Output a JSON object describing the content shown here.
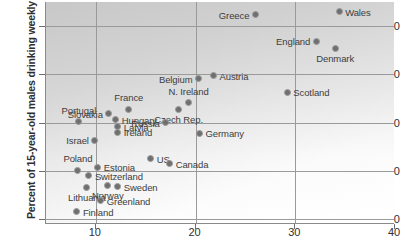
{
  "chart_data": {
    "type": "scatter",
    "title": "",
    "xlabel": "",
    "ylabel": "Percent of 15-year-old males drinking weekly",
    "xlim": [
      5,
      40
    ],
    "ylim": [
      9,
      55
    ],
    "xticks": [
      10,
      20,
      30,
      40
    ],
    "yticks": [
      10,
      20,
      30,
      40,
      50
    ],
    "grid": true,
    "legend": "none",
    "marker_color": "#6f6f6f",
    "marker_edge_color": "#9b9b9b",
    "grid_color": "#9a9a9a",
    "axis_color": "#8a8a8a",
    "points": [
      {
        "label": "Wales",
        "x": 34.4,
        "y": 53.0,
        "side": "r"
      },
      {
        "label": "Greece",
        "x": 26.0,
        "y": 52.4,
        "side": "l"
      },
      {
        "label": "England",
        "x": 32.1,
        "y": 46.9,
        "side": "l"
      },
      {
        "label": "Denmark",
        "x": 34.0,
        "y": 45.4,
        "side": "b"
      },
      {
        "label": "Austria",
        "x": 21.8,
        "y": 39.7,
        "side": "r"
      },
      {
        "label": "Belgium",
        "x": 20.3,
        "y": 39.1,
        "side": "l"
      },
      {
        "label": "Scotland",
        "x": 29.2,
        "y": 36.3,
        "side": "r"
      },
      {
        "label": "N. Ireland",
        "x": 19.3,
        "y": 34.1,
        "side": "t"
      },
      {
        "label": "Czech Rep.",
        "x": 18.3,
        "y": 32.8,
        "side": "b"
      },
      {
        "label": "France",
        "x": 13.3,
        "y": 32.8,
        "side": "t"
      },
      {
        "label": "Slovakia",
        "x": 11.3,
        "y": 31.8,
        "side": "l"
      },
      {
        "label": "Portugal",
        "x": 8.3,
        "y": 30.2,
        "side": "t"
      },
      {
        "label": "Hungary",
        "x": 12.0,
        "y": 30.6,
        "side": "r"
      },
      {
        "label": "Russia",
        "x": 17.0,
        "y": 30.0,
        "side": "l"
      },
      {
        "label": "Latvia",
        "x": 12.2,
        "y": 29.2,
        "side": "r"
      },
      {
        "label": "Ireland",
        "x": 12.2,
        "y": 28.0,
        "side": "r"
      },
      {
        "label": "Germany",
        "x": 20.4,
        "y": 27.8,
        "side": "r"
      },
      {
        "label": "Israel",
        "x": 9.9,
        "y": 26.4,
        "side": "l"
      },
      {
        "label": "US",
        "x": 15.5,
        "y": 22.5,
        "side": "r"
      },
      {
        "label": "Canada",
        "x": 17.4,
        "y": 21.5,
        "side": "r"
      },
      {
        "label": "Estonia",
        "x": 10.2,
        "y": 20.8,
        "side": "r"
      },
      {
        "label": "Poland",
        "x": 8.2,
        "y": 20.1,
        "side": "t"
      },
      {
        "label": "Switzerland",
        "x": 9.3,
        "y": 19.0,
        "side": "r"
      },
      {
        "label": "Sweden",
        "x": 12.2,
        "y": 16.7,
        "side": "r"
      },
      {
        "label": "Norway",
        "x": 11.2,
        "y": 17.0,
        "side": "b"
      },
      {
        "label": "Lithuania",
        "x": 9.1,
        "y": 16.6,
        "side": "b"
      },
      {
        "label": "Greenland",
        "x": 10.5,
        "y": 13.8,
        "side": "r"
      },
      {
        "label": "Finland",
        "x": 8.1,
        "y": 11.5,
        "side": "r"
      }
    ]
  }
}
